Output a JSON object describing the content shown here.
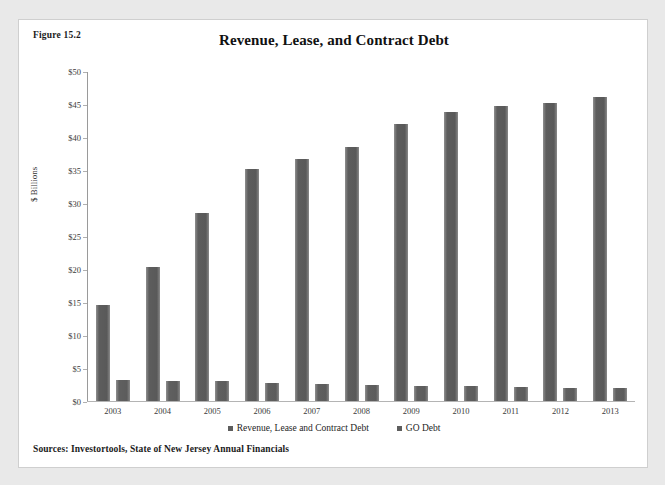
{
  "page": {
    "background_color": "#e9e9e9",
    "card_background": "#ffffff"
  },
  "figure_label": "Figure 15.2",
  "source_note": "Sources: Investortools, State of New Jersey Annual Financials",
  "legend": {
    "items": [
      {
        "label": "Revenue, Lease and Contract Debt",
        "color": "#5d5d5d",
        "marker": "square-swatch"
      },
      {
        "label": "GO Debt",
        "color": "#5d5d5d",
        "marker": "square-swatch"
      }
    ]
  },
  "chart_data": {
    "type": "bar",
    "title": "Revenue, Lease, and Contract Debt",
    "xlabel": "",
    "ylabel": "$ Billions",
    "categories": [
      "2003",
      "2004",
      "2005",
      "2006",
      "2007",
      "2008",
      "2009",
      "2010",
      "2011",
      "2012",
      "2013"
    ],
    "series": [
      {
        "name": "Revenue, Lease and Contract Debt",
        "color": "#5d5d5d",
        "values": [
          14.6,
          20.3,
          28.5,
          35.2,
          36.6,
          38.5,
          41.9,
          43.8,
          44.7,
          45.2,
          46.0
        ]
      },
      {
        "name": "GO Debt",
        "color": "#5d5d5d",
        "values": [
          3.2,
          3.1,
          3.0,
          2.8,
          2.6,
          2.4,
          2.3,
          2.2,
          2.1,
          1.9,
          1.9
        ]
      }
    ],
    "ylim": [
      0,
      50
    ],
    "yticks": [
      0,
      5,
      10,
      15,
      20,
      25,
      30,
      35,
      40,
      45,
      50
    ],
    "ytick_labels": [
      "$0",
      "$5",
      "$10",
      "$15",
      "$20",
      "$25",
      "$30",
      "$35",
      "$40",
      "$45",
      "$50"
    ],
    "grid": false,
    "legend_position": "bottom"
  }
}
